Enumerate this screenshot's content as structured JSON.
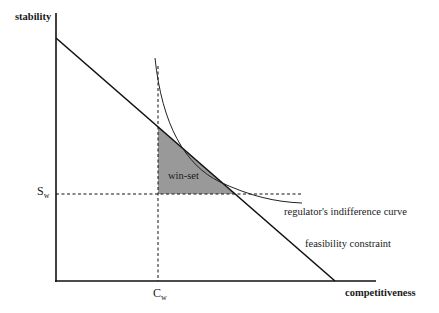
{
  "diagram": {
    "y_axis_label": "stability",
    "x_axis_label": "competitiveness",
    "s_label_main": "S",
    "s_label_sub": "w",
    "c_label_main": "C",
    "c_label_sub": "w",
    "region_label": "win-set",
    "curve_label": "regulator's indifference curve",
    "line_label": "feasibility constraint",
    "colors": {
      "axis": "#111111",
      "line": "#111111",
      "winset_fill": "#999999",
      "curve": "#222222"
    }
  }
}
